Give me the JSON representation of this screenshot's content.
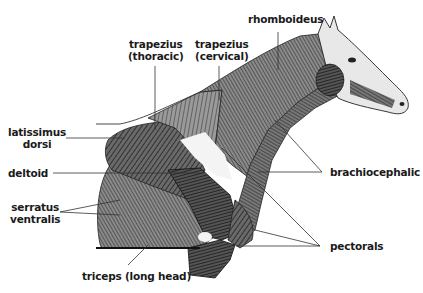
{
  "diagram": {
    "labels": [
      {
        "id": "trapezius-thoracic",
        "lines": [
          "trapezius",
          "(thoracic)"
        ]
      },
      {
        "id": "trapezius-cervical",
        "lines": [
          "trapezius",
          "(cervical)"
        ]
      },
      {
        "id": "rhomboideus",
        "lines": [
          "rhomboideus"
        ]
      },
      {
        "id": "latissimus-dorsi",
        "lines": [
          "latissimus",
          "dorsi"
        ]
      },
      {
        "id": "deltoid",
        "lines": [
          "deltoid"
        ]
      },
      {
        "id": "serratus-ventralis",
        "lines": [
          "serratus",
          "ventralis"
        ]
      },
      {
        "id": "brachiocephalic",
        "lines": [
          "brachiocephalic"
        ]
      },
      {
        "id": "pectorals",
        "lines": [
          "pectorals"
        ]
      },
      {
        "id": "triceps-long-head",
        "lines": [
          "triceps (long head)"
        ]
      }
    ]
  }
}
